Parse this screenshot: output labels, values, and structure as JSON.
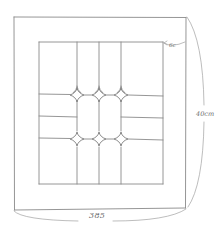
{
  "drawing": {
    "subject": "leaded glass panel sketch",
    "stroke_color": "#8a8a8a",
    "background": "#ffffff"
  },
  "annotations": {
    "width_label": "385",
    "height_label": "40cm",
    "border_label": "6c"
  },
  "geometry": {
    "outer_frame": {
      "x1": 14,
      "y1": 17,
      "x2": 186,
      "y2": 210
    },
    "inner_panel": {
      "x1": 39,
      "y1": 42,
      "x2": 163,
      "y2": 184
    },
    "vertical_leads_x": [
      76,
      99,
      121
    ],
    "diamond_rows_y": [
      95,
      139
    ],
    "diamond_count": 6
  }
}
